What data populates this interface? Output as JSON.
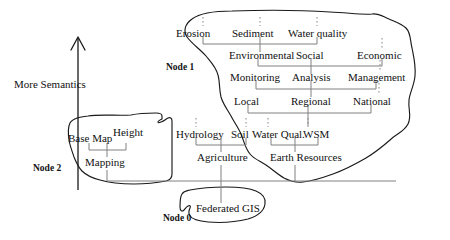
{
  "figure": {
    "axis_label": "More Semantics",
    "axis_direction": "up"
  },
  "nodes": [
    {
      "id": "node0",
      "label": "Node 0"
    },
    {
      "id": "node1",
      "label": "Node 1"
    },
    {
      "id": "node2",
      "label": "Node 2"
    }
  ],
  "terms": {
    "erosion": "Erosion",
    "sediment": "Sediment",
    "water_quality": "Water quality",
    "environmental": "Environmental",
    "social": "Social",
    "economic": "Economic",
    "monitoring": "Monitoring",
    "analysis": "Analysis",
    "management": "Management",
    "local": "Local",
    "regional": "Regional",
    "national": "National",
    "hydrology": "Hydrology",
    "soil": "Soil",
    "water_qual": "Water Qual.",
    "wsm": "WSM",
    "agriculture": "Agriculture",
    "earth_resources": "Earth Resources",
    "base_map": "Base Map",
    "height": "Height",
    "mapping": "Mapping",
    "federated_gis": "Federated GIS"
  },
  "colors": {
    "ink": "#111111",
    "line": "#808080",
    "outline": "#1a1a1a",
    "background": "#ffffff"
  }
}
